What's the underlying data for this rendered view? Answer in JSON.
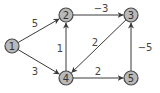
{
  "graph": {
    "type": "directed-weighted",
    "nodes": [
      {
        "id": "1",
        "label": "1",
        "x": 12,
        "y": 46
      },
      {
        "id": "2",
        "label": "2",
        "x": 66,
        "y": 15
      },
      {
        "id": "3",
        "label": "3",
        "x": 131,
        "y": 15
      },
      {
        "id": "4",
        "label": "4",
        "x": 66,
        "y": 78
      },
      {
        "id": "5",
        "label": "5",
        "x": 131,
        "y": 78
      }
    ],
    "edges": [
      {
        "from": "1",
        "to": "2",
        "weight": "5",
        "lx": 35,
        "ly": 23
      },
      {
        "from": "1",
        "to": "4",
        "weight": "3",
        "lx": 35,
        "ly": 71
      },
      {
        "from": "2",
        "to": "3",
        "weight": "−3",
        "lx": 101,
        "ly": 8
      },
      {
        "from": "4",
        "to": "2",
        "weight": "1",
        "lx": 60,
        "ly": 48
      },
      {
        "from": "3",
        "to": "4",
        "weight": "2",
        "lx": 95,
        "ly": 42
      },
      {
        "from": "4",
        "to": "5",
        "weight": "2",
        "lx": 98,
        "ly": 71
      },
      {
        "from": "5",
        "to": "3",
        "weight": "−5",
        "lx": 145,
        "ly": 47
      }
    ]
  },
  "style": {
    "node_fill": "#b9b9b9",
    "node_stroke": "#4a4a4a",
    "edge_color": "#3a3a3a"
  }
}
